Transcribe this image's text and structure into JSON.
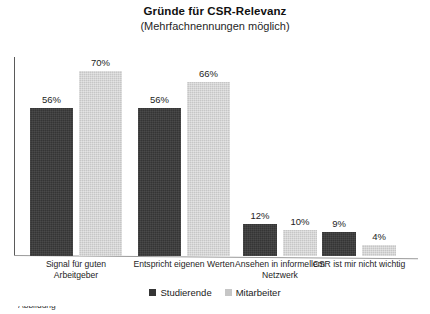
{
  "chart_data": {
    "type": "bar",
    "title": "Gründe für CSR-Relevanz",
    "subtitle": "(Mehrfachnennungen möglich)",
    "xlabel": "",
    "ylabel": "",
    "ylim": [
      0,
      75
    ],
    "grid": false,
    "legend_position": "bottom",
    "value_suffix": "%",
    "categories": [
      "Signal für guten Arbeitgeber",
      "Entspricht eigenen Werten",
      "Ansehen in informellem Netzwerk",
      "CSR ist mir nicht wichtig"
    ],
    "series": [
      {
        "name": "Studierende",
        "color": "#353535",
        "values": [
          56,
          56,
          12,
          9
        ],
        "labels": [
          "56%",
          "56%",
          "12%",
          "9%"
        ]
      },
      {
        "name": "Mitarbeiter",
        "color": "#c6c6c6",
        "values": [
          70,
          66,
          10,
          4
        ],
        "labels": [
          "70%",
          "66%",
          "10%",
          "4%"
        ]
      }
    ]
  },
  "caption": {
    "partial_text": "Abbildung"
  }
}
